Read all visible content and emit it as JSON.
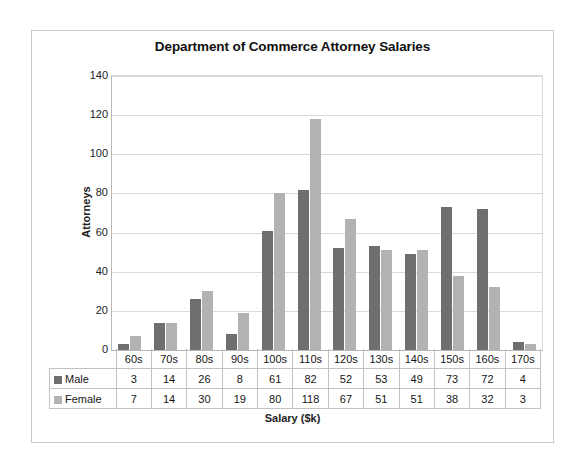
{
  "chart_data": {
    "type": "bar",
    "title": "Department of Commerce Attorney Salaries",
    "xlabel": "Salary ($k)",
    "ylabel": "Attorneys",
    "ylim": [
      0,
      140
    ],
    "ytick_step": 20,
    "yticks": [
      "140",
      "120",
      "100",
      "80",
      "60",
      "40",
      "20",
      "0"
    ],
    "grid": "horizontal",
    "legend_position": "data-table",
    "categories": [
      "60s",
      "70s",
      "80s",
      "90s",
      "100s",
      "110s",
      "120s",
      "130s",
      "140s",
      "150s",
      "160s",
      "170s"
    ],
    "series": [
      {
        "name": "Male",
        "color": "#6f6f6f",
        "values": [
          3,
          14,
          26,
          8,
          61,
          82,
          52,
          53,
          49,
          73,
          72,
          4
        ]
      },
      {
        "name": "Female",
        "color": "#b2b2b2",
        "values": [
          7,
          14,
          30,
          19,
          80,
          118,
          67,
          51,
          51,
          38,
          32,
          3
        ]
      }
    ]
  }
}
